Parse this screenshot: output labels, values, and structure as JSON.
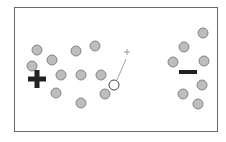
{
  "diagram": {
    "title": "",
    "frame": {
      "x": 14,
      "y": 7,
      "w": 204,
      "h": 125,
      "stroke": "#6a6a6a"
    },
    "colors": {
      "particle_fill": "#bdbdbd",
      "particle_stroke": "#7a7a7a",
      "test_particle_fill": "#ffffff",
      "plate_symbol": "#222222",
      "trajectory": "#8a8a8a"
    },
    "positive_plate": {
      "symbol": "+",
      "cx": 37,
      "cy": 79
    },
    "negative_plate": {
      "symbol": "−",
      "cx": 188,
      "cy": 72
    },
    "particles": [
      {
        "cx": 37,
        "cy": 50
      },
      {
        "cx": 76,
        "cy": 51
      },
      {
        "cx": 95,
        "cy": 46
      },
      {
        "cx": 52,
        "cy": 60
      },
      {
        "cx": 32,
        "cy": 66
      },
      {
        "cx": 61,
        "cy": 75
      },
      {
        "cx": 81,
        "cy": 75
      },
      {
        "cx": 101,
        "cy": 75
      },
      {
        "cx": 56,
        "cy": 93
      },
      {
        "cx": 105,
        "cy": 94
      },
      {
        "cx": 81,
        "cy": 103
      },
      {
        "cx": 203,
        "cy": 33
      },
      {
        "cx": 184,
        "cy": 47
      },
      {
        "cx": 173,
        "cy": 62
      },
      {
        "cx": 204,
        "cy": 61
      },
      {
        "cx": 202,
        "cy": 85
      },
      {
        "cx": 183,
        "cy": 94
      },
      {
        "cx": 198,
        "cy": 104
      }
    ],
    "test_particle": {
      "cx": 114,
      "cy": 85,
      "label": "open-circle"
    },
    "target_marker": {
      "symbol": "+",
      "cx": 127,
      "cy": 52
    },
    "trajectory": {
      "x1": 117,
      "y1": 80,
      "x2": 126,
      "y2": 59
    },
    "caption": ""
  }
}
